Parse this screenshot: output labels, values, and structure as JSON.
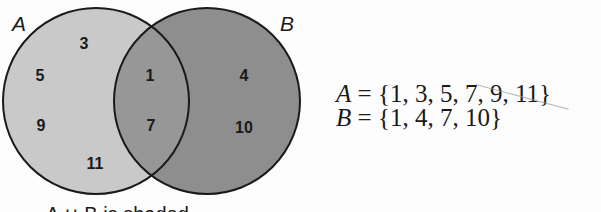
{
  "diagram": {
    "type": "venn",
    "sets": [
      {
        "name": "A",
        "label": "A",
        "only_elements": [
          "3",
          "5",
          "9",
          "11"
        ],
        "fill": "#c9c9c9"
      },
      {
        "name": "B",
        "label": "B",
        "only_elements": [
          "4",
          "10"
        ],
        "fill": "#8e8e8e"
      }
    ],
    "intersection": {
      "elements": [
        "1",
        "7"
      ],
      "fill": "#979797"
    },
    "regions": {
      "a_only": {
        "e3": "3",
        "e5": "5",
        "e9": "9",
        "e11": "11"
      },
      "a_and_b": {
        "e1": "1",
        "e7": "7"
      },
      "b_only": {
        "e4": "4",
        "e10": "10"
      }
    },
    "caption": "A ∪ B is shaded",
    "outline_color": "#1a1a1a"
  },
  "equations": {
    "a": {
      "var": "A",
      "rest": " = {1, 3, 5, 7, 9, 11}"
    },
    "b": {
      "var": "B",
      "rest": " = {1, 4, 7, 10}"
    }
  }
}
